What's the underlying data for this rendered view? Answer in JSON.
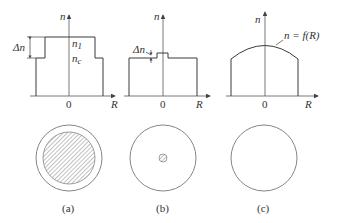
{
  "figure": {
    "panels": [
      {
        "id": "a",
        "caption": "(a)",
        "profile": "step-index",
        "axis_y_label": "n",
        "axis_x_label": "R",
        "origin_label": "0",
        "delta_label": "Δn",
        "core_index_label": "n",
        "core_index_sub": "1",
        "cladding_index_label": "n",
        "cladding_index_sub": "c",
        "cross_section": "large hatched core inside cladding ring"
      },
      {
        "id": "b",
        "caption": "(b)",
        "profile": "small-step (single-mode)",
        "axis_y_label": "n",
        "axis_x_label": "R",
        "origin_label": "0",
        "delta_label": "Δn",
        "cross_section": "small hatched core at center"
      },
      {
        "id": "c",
        "caption": "(c)",
        "profile": "graded-index",
        "axis_y_label": "n",
        "axis_x_label": "R",
        "origin_label": "0",
        "curve_label": "n = f(R)",
        "cross_section": "plain circle, no distinct core"
      }
    ]
  }
}
